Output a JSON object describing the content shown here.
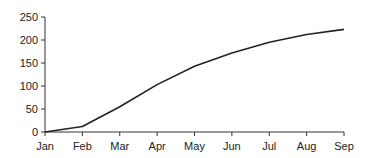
{
  "chart_data": {
    "type": "line",
    "title": "",
    "xlabel": "",
    "ylabel": "",
    "categories": [
      "Jan",
      "Feb",
      "Mar",
      "Apr",
      "May",
      "Jun",
      "Jul",
      "Aug",
      "Sep"
    ],
    "series": [
      {
        "name": "",
        "values": [
          0,
          12,
          55,
          103,
          143,
          172,
          195,
          212,
          223
        ]
      }
    ],
    "ylim": [
      0,
      250
    ],
    "yticks": [
      "0",
      "50",
      "100",
      "150",
      "200",
      "250"
    ],
    "grid": false,
    "legend": null,
    "line_color": "#222222"
  }
}
